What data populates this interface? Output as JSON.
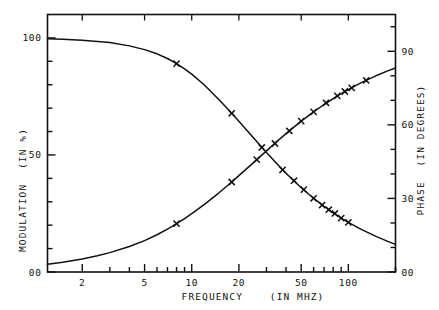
{
  "chart_data": {
    "type": "line",
    "title": "",
    "xlabel": "FREQUENCY",
    "xlabel_units": "(IN MHZ)",
    "xscale": "log",
    "xlim": [
      1.2,
      200
    ],
    "xticks": [
      2,
      5,
      10,
      20,
      50,
      100
    ],
    "xticklabels": [
      "2",
      "5",
      "10",
      "20",
      "50",
      "100"
    ],
    "grid": false,
    "legend": "none",
    "axes": [
      {
        "id": "left",
        "label": "MODULATION",
        "units": "(IN %)",
        "ylim": [
          0,
          110
        ],
        "yticks": [
          0,
          50,
          100
        ],
        "yticklabels": [
          "00",
          "50",
          "100"
        ],
        "minor_ticks": [
          10,
          20,
          30,
          40,
          60,
          70,
          80,
          90
        ]
      },
      {
        "id": "right",
        "label": "PHASE",
        "units": "(IN DEGREES)",
        "ylim": [
          0,
          105
        ],
        "yticks": [
          0,
          30,
          60,
          90
        ],
        "yticklabels": [
          "00",
          "30",
          "60",
          "90"
        ],
        "minor_ticks": [
          10,
          20,
          40,
          50,
          70,
          80,
          100
        ]
      }
    ],
    "series": [
      {
        "name": "MODULATION",
        "axis": "left",
        "marker": "x",
        "units": "%",
        "curve": [
          [
            1.2,
            99.6
          ],
          [
            1.5,
            99.4
          ],
          [
            2.0,
            99.0
          ],
          [
            2.5,
            98.5
          ],
          [
            3.0,
            98.0
          ],
          [
            4.0,
            96.6
          ],
          [
            5.0,
            95.0
          ],
          [
            6.0,
            93.2
          ],
          [
            7.0,
            91.2
          ],
          [
            8.0,
            89.0
          ],
          [
            9.0,
            86.8
          ],
          [
            10.0,
            84.5
          ],
          [
            12.0,
            80.0
          ],
          [
            15.0,
            73.5
          ],
          [
            18.0,
            67.8
          ],
          [
            20.0,
            64.4
          ],
          [
            25.0,
            57.0
          ],
          [
            30.0,
            51.0
          ],
          [
            35.0,
            46.2
          ],
          [
            40.0,
            42.2
          ],
          [
            50.0,
            36.0
          ],
          [
            60.0,
            31.5
          ],
          [
            70.0,
            28.0
          ],
          [
            80.0,
            25.3
          ],
          [
            90.0,
            23.0
          ],
          [
            100.0,
            21.2
          ],
          [
            120.0,
            18.3
          ],
          [
            150.0,
            15.2
          ],
          [
            180.0,
            13.0
          ],
          [
            200.0,
            11.8
          ]
        ],
        "points": [
          [
            8.0,
            89.0
          ],
          [
            18.0,
            67.8
          ],
          [
            28.0,
            53.2
          ],
          [
            38.0,
            43.6
          ],
          [
            45.0,
            39.0
          ],
          [
            52.0,
            35.2
          ],
          [
            60.0,
            31.5
          ],
          [
            68.0,
            28.6
          ],
          [
            75.0,
            26.6
          ],
          [
            82.0,
            25.0
          ],
          [
            90.0,
            23.0
          ],
          [
            100.0,
            21.2
          ]
        ]
      },
      {
        "name": "PHASE",
        "axis": "right",
        "marker": "x",
        "units": "degrees",
        "curve": [
          [
            1.2,
            3.2
          ],
          [
            1.5,
            4.0
          ],
          [
            2.0,
            5.3
          ],
          [
            2.5,
            6.6
          ],
          [
            3.0,
            7.9
          ],
          [
            4.0,
            10.4
          ],
          [
            5.0,
            12.8
          ],
          [
            6.0,
            15.2
          ],
          [
            7.0,
            17.5
          ],
          [
            8.0,
            19.7
          ],
          [
            9.0,
            21.8
          ],
          [
            10.0,
            23.8
          ],
          [
            12.0,
            27.5
          ],
          [
            15.0,
            32.4
          ],
          [
            18.0,
            36.7
          ],
          [
            20.0,
            39.3
          ],
          [
            25.0,
            44.8
          ],
          [
            30.0,
            49.4
          ],
          [
            35.0,
            53.2
          ],
          [
            40.0,
            56.4
          ],
          [
            50.0,
            61.5
          ],
          [
            60.0,
            65.3
          ],
          [
            70.0,
            68.3
          ],
          [
            80.0,
            70.7
          ],
          [
            90.0,
            72.7
          ],
          [
            100.0,
            74.4
          ],
          [
            120.0,
            77.1
          ],
          [
            150.0,
            80.0
          ],
          [
            180.0,
            82.1
          ],
          [
            200.0,
            83.2
          ]
        ],
        "points": [
          [
            8.0,
            19.7
          ],
          [
            18.0,
            36.7
          ],
          [
            26.0,
            45.8
          ],
          [
            34.0,
            52.4
          ],
          [
            42.0,
            57.5
          ],
          [
            50.0,
            61.5
          ],
          [
            60.0,
            65.3
          ],
          [
            72.0,
            69.0
          ],
          [
            85.0,
            71.8
          ],
          [
            95.0,
            73.6
          ],
          [
            105.0,
            75.1
          ],
          [
            130.0,
            78.1
          ]
        ]
      }
    ]
  }
}
